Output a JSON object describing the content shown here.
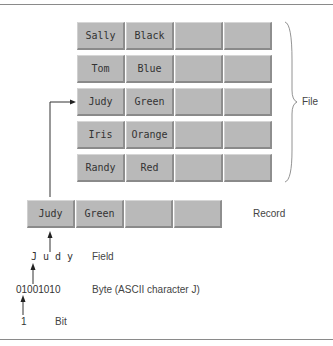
{
  "file_records": [
    {
      "fields": [
        "Sally",
        "Black",
        "",
        ""
      ]
    },
    {
      "fields": [
        "Tom",
        "Blue",
        "",
        ""
      ]
    },
    {
      "fields": [
        "Judy",
        "Green",
        "",
        ""
      ]
    },
    {
      "fields": [
        "Iris",
        "Orange",
        "",
        ""
      ]
    },
    {
      "fields": [
        "Randy",
        "Red",
        "",
        ""
      ]
    }
  ],
  "record": {
    "fields": [
      "Judy",
      "Green",
      "",
      ""
    ]
  },
  "labels": {
    "file": "File",
    "record": "Record",
    "field_value": "J u d y",
    "field": "Field",
    "byte_value": "01001010",
    "byte": "Byte (ASCII character J)",
    "bit_value": "1",
    "bit": "Bit"
  }
}
